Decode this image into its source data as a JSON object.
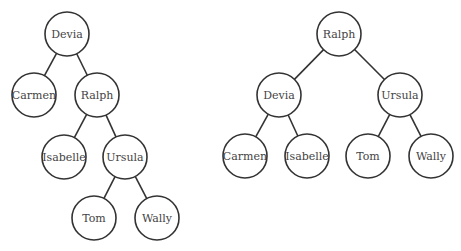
{
  "colors": {
    "stroke": "#333333",
    "text": "#444444",
    "node_fill": "#ffffff",
    "background": "#ffffff"
  },
  "node_radius": 22,
  "trees": [
    {
      "name": "tree-before-rotation",
      "root": "Devia",
      "nodes": [
        {
          "id": "devia",
          "label": "Devia",
          "cx": 67,
          "cy": 34
        },
        {
          "id": "carmen",
          "label": "Carmen",
          "cx": 34,
          "cy": 95
        },
        {
          "id": "ralph",
          "label": "Ralph",
          "cx": 97,
          "cy": 95
        },
        {
          "id": "isabelle",
          "label": "Isabelle",
          "cx": 64,
          "cy": 157
        },
        {
          "id": "ursula",
          "label": "Ursula",
          "cx": 125,
          "cy": 157
        },
        {
          "id": "tom",
          "label": "Tom",
          "cx": 94,
          "cy": 218
        },
        {
          "id": "wally",
          "label": "Wally",
          "cx": 157,
          "cy": 218
        }
      ],
      "edges": [
        [
          "devia",
          "carmen"
        ],
        [
          "devia",
          "ralph"
        ],
        [
          "ralph",
          "isabelle"
        ],
        [
          "ralph",
          "ursula"
        ],
        [
          "ursula",
          "tom"
        ],
        [
          "ursula",
          "wally"
        ]
      ]
    },
    {
      "name": "tree-after-rotation",
      "root": "Ralph",
      "nodes": [
        {
          "id": "ralph",
          "label": "Ralph",
          "cx": 339,
          "cy": 34
        },
        {
          "id": "devia",
          "label": "Devia",
          "cx": 279,
          "cy": 95
        },
        {
          "id": "ursula",
          "label": "Ursula",
          "cx": 400,
          "cy": 95
        },
        {
          "id": "carmen",
          "label": "Carmen",
          "cx": 245,
          "cy": 156
        },
        {
          "id": "isabelle",
          "label": "Isabelle",
          "cx": 307,
          "cy": 156
        },
        {
          "id": "tom",
          "label": "Tom",
          "cx": 368,
          "cy": 156
        },
        {
          "id": "wally",
          "label": "Wally",
          "cx": 431,
          "cy": 156
        }
      ],
      "edges": [
        [
          "ralph",
          "devia"
        ],
        [
          "ralph",
          "ursula"
        ],
        [
          "devia",
          "carmen"
        ],
        [
          "devia",
          "isabelle"
        ],
        [
          "ursula",
          "tom"
        ],
        [
          "ursula",
          "wally"
        ]
      ]
    }
  ]
}
